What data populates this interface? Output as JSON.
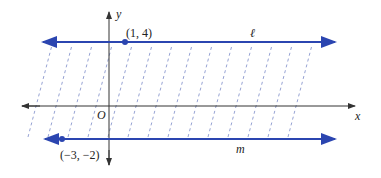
{
  "diagram": {
    "axes": {
      "x_label": "x",
      "y_label": "y",
      "origin_label": "O",
      "axis_color": "#333333"
    },
    "lines": [
      {
        "name": "ℓ",
        "y_value": 4,
        "color": "#2b45b0"
      },
      {
        "name": "m",
        "y_value": -2,
        "color": "#2b45b0"
      }
    ],
    "points": [
      {
        "label": "(1, 4)",
        "x": 1,
        "y": 4
      },
      {
        "label": "(−3, −2)",
        "x": -3,
        "y": -2
      }
    ],
    "shading": {
      "style": "dashed diagonal hatching",
      "color": "#6a7cc0",
      "region": "between lines ℓ and m"
    }
  }
}
